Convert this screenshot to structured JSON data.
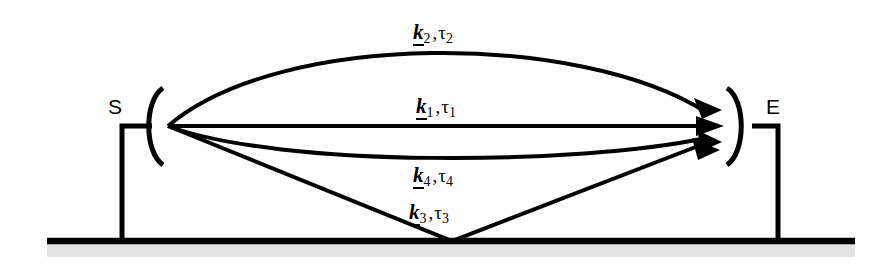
{
  "figure": {
    "background_color": "#ffffff",
    "ink_color": "#000000",
    "ground_shadow_color": "#e3e3e3"
  },
  "nodes": {
    "source": {
      "letter": "S",
      "name": "source",
      "x": 168,
      "y": 126,
      "bracket": "left-paren-arc"
    },
    "receiver": {
      "letter": "E",
      "name": "receiver",
      "x": 740,
      "y": 126,
      "bracket": "right-paren-arc"
    }
  },
  "ground": {
    "label": "ground-line",
    "y": 241,
    "x_start": 47,
    "x_end": 855,
    "shadow_height": 13
  },
  "supports": [
    {
      "name": "source-support-post",
      "x": 122,
      "y_top": 126,
      "y_bottom": 241
    },
    {
      "name": "receiver-support-post",
      "x": 778,
      "y_top": 126,
      "y_bottom": 241
    }
  ],
  "rays": [
    {
      "id": "k2",
      "name": "ray-path-k2",
      "k_symbol": "k",
      "k_subscript": "2",
      "comma": ",",
      "tau_symbol": "τ",
      "tau_subscript": "2",
      "label_text": "k2,τ2",
      "shape": "arc-upward",
      "label_x": 413,
      "label_y": 22
    },
    {
      "id": "k1",
      "name": "ray-path-k1",
      "k_symbol": "k",
      "k_subscript": "1",
      "comma": ",",
      "tau_symbol": "τ",
      "tau_subscript": "1",
      "label_text": "k1,τ1",
      "shape": "straight-direct",
      "label_x": 416,
      "label_y": 96
    },
    {
      "id": "k4",
      "name": "ray-path-k4",
      "k_symbol": "k",
      "k_subscript": "4",
      "comma": ",",
      "tau_symbol": "τ",
      "tau_subscript": "4",
      "label_text": "k4,τ4",
      "shape": "arc-downward",
      "label_x": 413,
      "label_y": 165
    },
    {
      "id": "k3",
      "name": "ray-path-k3",
      "k_symbol": "k",
      "k_subscript": "3",
      "comma": ",",
      "tau_symbol": "τ",
      "tau_subscript": "3",
      "label_text": "k3,τ3",
      "shape": "ground-reflection",
      "reflection_point_x": 452,
      "reflection_point_y": 241,
      "label_x": 409,
      "label_y": 202
    }
  ]
}
